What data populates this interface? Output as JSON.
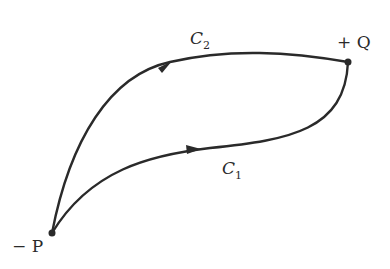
{
  "diagram": {
    "colors": {
      "stroke": "#2a2a2a",
      "background": "#ffffff"
    },
    "points": [
      {
        "id": "P",
        "label": "− P",
        "x": 52,
        "y": 233
      },
      {
        "id": "Q",
        "label": "+ Q",
        "x": 348,
        "y": 62
      }
    ],
    "curves": [
      {
        "id": "C1",
        "name": "C",
        "subscript": "1",
        "from": "P",
        "to": "Q"
      },
      {
        "id": "C2",
        "name": "C",
        "subscript": "2",
        "from": "P",
        "to": "Q"
      }
    ]
  }
}
